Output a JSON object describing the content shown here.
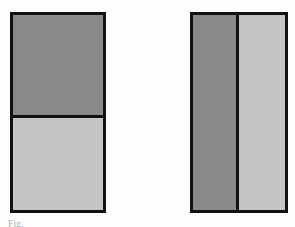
{
  "figure": {
    "background_color": "#fdfdfd",
    "border_color": "#111111",
    "tone_dark": "#8a8a8a",
    "tone_light": "#c9c9c9",
    "left": {
      "name": "left-figure",
      "split": "horizontal",
      "panels": [
        {
          "label": "top panel",
          "tone": "dark"
        },
        {
          "label": "bottom panel",
          "tone": "light"
        }
      ]
    },
    "right": {
      "name": "right-figure",
      "split": "vertical",
      "panels": [
        {
          "label": "left panel",
          "tone": "dark"
        },
        {
          "label": "right panel",
          "tone": "light"
        }
      ]
    }
  },
  "caption": {
    "text": "Fig.",
    "note": "caption line is clipped by the bottom edge of the image and is not legible"
  }
}
